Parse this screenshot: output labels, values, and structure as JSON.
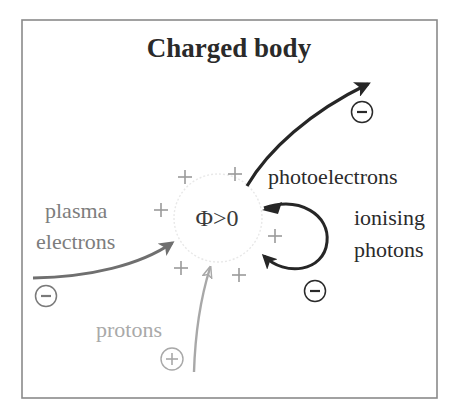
{
  "title": "Charged body",
  "body_label": "Φ>0",
  "labels": {
    "photoelectrons": "photoelectrons",
    "ionising_line1": "ionising",
    "ionising_line2": "photons",
    "plasma_line1": "plasma",
    "plasma_line2": "electrons",
    "protons": "protons"
  },
  "charge_symbols": {
    "electron": "−",
    "proton": "+"
  },
  "colors": {
    "frame": "#8a8a8a",
    "dark_arrow": "#262626",
    "plasma_arrow": "#6f6f6f",
    "proton_arrow": "#a8a8a8",
    "surface_plus": "#9a9a9a",
    "body_outline": "#e6e6e6"
  }
}
